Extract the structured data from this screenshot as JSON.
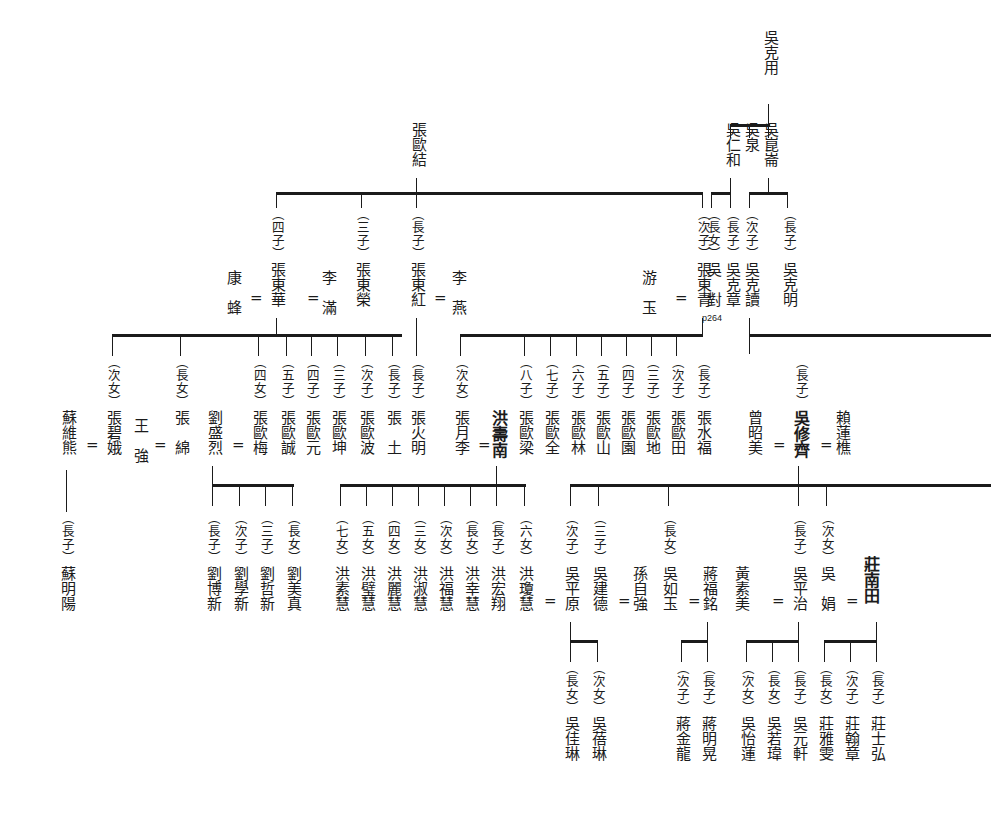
{
  "marks": {
    "union": "=",
    "page_ref": "p264"
  },
  "ranks": {
    "eldest_son": "（長子）",
    "second_son": "（次子）",
    "third_son": "（三子）",
    "fourth_son": "（四子）",
    "fifth_son": "（五子）",
    "sixth_son": "（六子）",
    "seventh_son": "（七子）",
    "eighth_son": "（八子）",
    "eldest_daughter": "（長女）",
    "second_daughter": "（次女）",
    "third_daughter": "（三女）",
    "fourth_daughter": "（四女）",
    "fifth_daughter": "（五女）",
    "sixth_daughter": "（六女）",
    "seventh_daughter": "（七女）"
  },
  "generation1": {
    "root": {
      "name": "吳克用"
    }
  },
  "generation2": [
    {
      "name": "吳崑崙",
      "rank": ""
    },
    {
      "name": "吳泉",
      "rank": ""
    },
    {
      "name": "吳仁和",
      "rank": ""
    },
    {
      "name": "張歐結",
      "rank": ""
    }
  ],
  "generation3_wu": [
    {
      "rank": "（長子）",
      "name": "吳克明"
    },
    {
      "rank": "（次子）",
      "name": "吳克讀"
    },
    {
      "rank": "（長子）",
      "name": "吳克章"
    },
    {
      "rank": "（長女）",
      "name": "吳　對",
      "note": "p264"
    }
  ],
  "generation3_zhang": [
    {
      "rank": "（四子）",
      "name": "張東華",
      "spouse_left": "康　蜂",
      "spouse_right": "李　滿"
    },
    {
      "rank": "（三子）",
      "name": "張東榮",
      "spouse_left": "",
      "spouse_right": ""
    },
    {
      "rank": "（長子）",
      "name": "張東紅",
      "spouse_left": "",
      "spouse_right": "李　燕"
    },
    {
      "rank": "（次子）",
      "name": "張東青",
      "spouse_left": "游　玉",
      "spouse_right": ""
    }
  ],
  "generation4_left": [
    {
      "rank": "（次女）",
      "name": "張碧娥",
      "spouse": "蘇維熊",
      "spouse_side": "left"
    },
    {
      "rank": "（長女）",
      "name": "張　綿",
      "spouse": "王　強",
      "spouse_side": "left"
    },
    {
      "rank": "（四女）",
      "name": "張歐梅",
      "spouse": "劉盛烈",
      "spouse_side": "left"
    },
    {
      "rank": "（五子）",
      "name": "張歐誠"
    },
    {
      "rank": "（四子）",
      "name": "張歐元"
    },
    {
      "rank": "（三子）",
      "name": "張歐坤"
    },
    {
      "rank": "（次子）",
      "name": "張歐波"
    },
    {
      "rank": "（長子）",
      "name": "張　土"
    }
  ],
  "generation4_mid": [
    {
      "rank": "（五子）",
      "name": "張歐誠"
    },
    {
      "rank": "（四子）",
      "name": "張歐元"
    },
    {
      "rank": "（三子）",
      "name": "張歐坤"
    },
    {
      "rank": "（次子）",
      "name": "張歐波"
    },
    {
      "rank": "（長子）",
      "name": "張火明"
    },
    {
      "rank": "（次女）",
      "name": "張月李",
      "spouse": "洪壽南"
    },
    {
      "rank": "（八子）",
      "name": "張歐梁"
    },
    {
      "rank": "（七子）",
      "name": "張歐全"
    },
    {
      "rank": "（六子）",
      "name": "張歐林"
    },
    {
      "rank": "（五子）",
      "name": "張歐山"
    },
    {
      "rank": "（四子）",
      "name": "張歐園"
    },
    {
      "rank": "（三子）",
      "name": "張歐地"
    },
    {
      "rank": "（次子）",
      "name": "張歐田"
    },
    {
      "rank": "（長子）",
      "name": "張水福"
    }
  ],
  "generation4_right": {
    "rank": "（長子）",
    "name": "吳修齊",
    "spouse_left": "曾昭美",
    "spouse_right": "賴蓮樵"
  },
  "generation5": {
    "su": [
      {
        "rank": "（長子）",
        "name": "蘇明陽"
      }
    ],
    "liu": [
      {
        "rank": "（長子）",
        "name": "劉博新"
      },
      {
        "rank": "（次子）",
        "name": "劉學新"
      },
      {
        "rank": "（三子）",
        "name": "劉哲新"
      },
      {
        "rank": "（長女）",
        "name": "劉美真"
      }
    ],
    "hong": [
      {
        "rank": "（七女）",
        "name": "洪素慧"
      },
      {
        "rank": "（五女）",
        "name": "洪璧慧"
      },
      {
        "rank": "（四女）",
        "name": "洪麗慧"
      },
      {
        "rank": "（三女）",
        "name": "洪淑慧"
      },
      {
        "rank": "（次女）",
        "name": "洪福慧"
      },
      {
        "rank": "（長女）",
        "name": "洪幸慧"
      },
      {
        "rank": "（長子）",
        "name": "洪宏翔"
      },
      {
        "rank": "（六女）",
        "name": "洪瓊慧"
      }
    ],
    "wu": [
      {
        "rank": "（次子）",
        "name": "吳平原"
      },
      {
        "rank": "（三子）",
        "name": "吳建德",
        "spouse": "孫自強"
      },
      {
        "rank": "（長女）",
        "name": "吳如玉",
        "spouse": "蔣福銘"
      },
      {
        "rank": "（長子）",
        "name": "吳平治",
        "spouse": "黃素美"
      },
      {
        "rank": "（次女）",
        "name": "吳　娟",
        "spouse": "莊南田"
      }
    ]
  },
  "generation6": {
    "wu_pingyuan": [
      {
        "rank": "（長女）",
        "name": "吳佳琳"
      },
      {
        "rank": "（次女）",
        "name": "吳蓓琳"
      }
    ],
    "jiang": [
      {
        "rank": "（次子）",
        "name": "蔣金龍"
      },
      {
        "rank": "（長子）",
        "name": "蔣明晃"
      }
    ],
    "wu_pingzhi": [
      {
        "rank": "（次女）",
        "name": "吳怡蓮"
      },
      {
        "rank": "（長女）",
        "name": "吳若瑋"
      },
      {
        "rank": "（長子）",
        "name": "吳元軒"
      }
    ],
    "zhuang": [
      {
        "rank": "（長女）",
        "name": "莊雅雯"
      },
      {
        "rank": "（次子）",
        "name": "莊翰章"
      },
      {
        "rank": "（長子）",
        "name": "莊士弘"
      }
    ]
  },
  "colors": {
    "ink": "#1b1b1b",
    "paper": "#ffffff"
  }
}
